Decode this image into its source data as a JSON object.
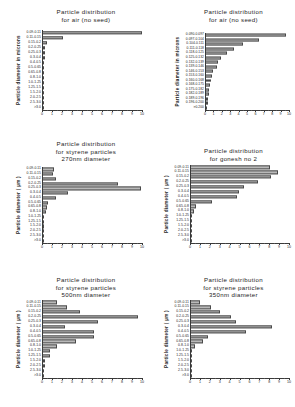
{
  "figure": {
    "panel_count": 6,
    "bar_color": "#b9b9b9",
    "bar_edge_color": "#4a4a4a",
    "axis_color": "#3a3a3a",
    "background": "#ffffff"
  },
  "chart_data": [
    {
      "type": "bar",
      "orientation": "horizontal",
      "title": "Particle distribution for air (no seed)",
      "title_lines": [
        "Particle distribution",
        "for air (no seed)"
      ],
      "xlabel": "",
      "ylabel": "Particle diameter in microns",
      "xlim": [
        0,
        10
      ],
      "ylim_categories": 16,
      "grid": false,
      "legend": "none",
      "xticks": [
        0,
        1,
        2,
        3,
        4,
        5,
        6,
        7,
        8,
        9,
        10
      ],
      "xticklabels": [
        "0",
        "1",
        "2",
        "3",
        "4",
        "5",
        "6",
        "7",
        "8",
        "9",
        "10"
      ],
      "categories": [
        "0.09-0.11",
        "0.11-0.15",
        "0.15-0.2",
        "0.2-0.25",
        "0.25-0.3",
        "0.3-0.4",
        "0.4-0.5",
        "0.5-0.65",
        "0.65-0.8",
        "0.8-1.0",
        "1.0-1.25",
        "1.25-1.5",
        "1.5-2.0",
        "2.0-2.5",
        "2.5-3.0",
        ">3.0"
      ],
      "values": [
        10.0,
        2.05,
        0.42,
        0.3,
        0.25,
        0.22,
        0.2,
        0.2,
        0.18,
        0.18,
        0.16,
        0.15,
        0.14,
        0.13,
        0.12,
        0.1
      ]
    },
    {
      "type": "bar",
      "orientation": "horizontal",
      "title": "Particle distribution for air (no seed)",
      "title_lines": [
        "Particle distribution",
        "for air (no seed)"
      ],
      "xlabel": "",
      "ylabel": "Particle diameter in microns",
      "xlim": [
        0,
        10
      ],
      "ylim_categories": 17,
      "grid": false,
      "legend": "none",
      "xticks": [
        0,
        1,
        2,
        3,
        4,
        5,
        6,
        7,
        8,
        9,
        10
      ],
      "xticklabels": [
        "0",
        "1",
        "2",
        "3",
        "4",
        "5",
        "6",
        "7",
        "8",
        "9",
        "10"
      ],
      "categories": [
        "0.090-0.097",
        "0.097-0.104",
        "0.104-0.111",
        "0.111-0.118",
        "0.118-0.125",
        "0.125-0.132",
        "0.132-0.139",
        "0.139-0.146",
        "0.146-0.153",
        "0.153-0.160",
        "0.160-0.168",
        "0.168-0.175",
        "0.175-0.182",
        "0.182-0.189",
        "0.189-0.196",
        "0.196-0.200",
        ">0.200"
      ],
      "values": [
        9.6,
        6.4,
        4.5,
        3.4,
        2.6,
        1.9,
        1.5,
        1.35,
        0.9,
        0.75,
        0.62,
        0.5,
        0.45,
        0.4,
        0.35,
        0.3,
        0.22
      ]
    },
    {
      "type": "bar",
      "orientation": "horizontal",
      "title": "Particle distribution for styrene particles 270nm diameter",
      "title_lines": [
        "Particle distribution",
        "for styrene particles",
        "270nm diameter"
      ],
      "xlabel": "",
      "ylabel": "Particle diameter  ( µm )",
      "xlim": [
        0,
        10
      ],
      "ylim_categories": 16,
      "grid": false,
      "legend": "none",
      "xticks": [
        0,
        1,
        2,
        3,
        4,
        5,
        6,
        7,
        8,
        9,
        10
      ],
      "xticklabels": [
        "0",
        "1",
        "2",
        "3",
        "4",
        "5",
        "6",
        "7",
        "8",
        "9",
        "10"
      ],
      "categories": [
        "0.09-0.11",
        "0.11-0.15",
        "0.15-0.2",
        "0.2-0.25",
        "0.25-0.3",
        "0.3-0.4",
        "0.4-0.5",
        "0.5-0.65",
        "0.65-0.8",
        "0.8-1.0",
        "1.0-1.25",
        "1.25-1.5",
        "1.5-2.0",
        "2.0-2.5",
        "2.5-3.0",
        ">3.0"
      ],
      "values": [
        1.15,
        1.1,
        1.35,
        7.6,
        9.9,
        2.6,
        1.35,
        0.55,
        0.45,
        0.4,
        0.2,
        0.15,
        0.12,
        0.1,
        0.1,
        0.08
      ]
    },
    {
      "type": "bar",
      "orientation": "horizontal",
      "title": "Particle distribution for gonesh no 2",
      "title_lines": [
        "Particle distribution",
        "for gonesh no 2"
      ],
      "xlabel": "",
      "ylabel": "Particle diameter  ( µm )",
      "xlim": [
        0,
        10
      ],
      "ylim_categories": 16,
      "grid": false,
      "legend": "none",
      "xticks": [
        0,
        1,
        2,
        3,
        4,
        5,
        6,
        7,
        8,
        9,
        10
      ],
      "xticklabels": [
        "0",
        "1",
        "2",
        "3",
        "4",
        "5",
        "6",
        "7",
        "8",
        "9",
        "10"
      ],
      "categories": [
        "0.09-0.11",
        "0.11-0.15",
        "0.15-0.2",
        "0.2-0.25",
        "0.25-0.3",
        "0.3-0.4",
        "0.4-0.5",
        "0.5-0.65",
        "0.65-0.8",
        "0.8-1.0",
        "1.0-1.25",
        "1.25-1.5",
        "1.5-2.0",
        "2.0-2.5",
        "2.5-3.0",
        ">3.0"
      ],
      "values": [
        8.0,
        8.8,
        8.1,
        6.8,
        5.4,
        4.9,
        4.7,
        2.2,
        0.55,
        0.35,
        0.1,
        0.1,
        0.08,
        0.08,
        0.07,
        0.06
      ]
    },
    {
      "type": "bar",
      "orientation": "horizontal",
      "title": "Particle distribution for styrene particles 500nm diameter",
      "title_lines": [
        "Particle distribution",
        "for styrene particles",
        "500nm diameter"
      ],
      "xlabel": "",
      "ylabel": "Particle diameter  ( µm )",
      "xlim": [
        0,
        10
      ],
      "ylim_categories": 16,
      "grid": false,
      "legend": "none",
      "xticks": [
        0,
        1,
        2,
        3,
        4,
        5,
        6,
        7,
        8,
        9,
        10
      ],
      "xticklabels": [
        "0",
        "1",
        "2",
        "3",
        "4",
        "5",
        "6",
        "7",
        "8",
        "9",
        "10"
      ],
      "categories": [
        "0.09-0.11",
        "0.11-0.15",
        "0.15-0.2",
        "0.2-0.25",
        "0.25-0.3",
        "0.3-0.4",
        "0.4-0.5",
        "0.5-0.65",
        "0.65-0.8",
        "0.8-1.0",
        "1.0-1.25",
        "1.25-1.5",
        "1.5-2.0",
        "2.0-2.5",
        "2.5-3.0",
        ">3.0"
      ],
      "values": [
        1.5,
        2.5,
        3.8,
        9.6,
        5.6,
        2.3,
        5.2,
        5.2,
        3.4,
        1.5,
        0.75,
        0.75,
        0.3,
        0.25,
        0.2,
        0.12
      ]
    },
    {
      "type": "bar",
      "orientation": "horizontal",
      "title": "Particle distribution for styrene particles 350nm diameter",
      "title_lines": [
        "Particle distribution",
        "for styrene particles",
        "350nm diameter"
      ],
      "xlabel": "",
      "ylabel": "Particle diameter  ( µm )",
      "xlim": [
        0,
        10
      ],
      "ylim_categories": 16,
      "grid": false,
      "legend": "none",
      "xticks": [
        0,
        1,
        2,
        3,
        4,
        5,
        6,
        7,
        8,
        9,
        10
      ],
      "xticklabels": [
        "0",
        "1",
        "2",
        "3",
        "4",
        "5",
        "6",
        "7",
        "8",
        "9",
        "10"
      ],
      "categories": [
        "0.09-0.11",
        "0.11-0.15",
        "0.15-0.2",
        "0.2-0.25",
        "0.25-0.3",
        "0.3-0.4",
        "0.4-0.5",
        "0.5-0.65",
        "0.65-0.8",
        "0.8-1.0",
        "1.0-1.25",
        "1.25-1.5",
        "1.5-2.0",
        "2.0-2.5",
        "2.5-3.0",
        ">3.0"
      ],
      "values": [
        1.0,
        2.1,
        3.0,
        4.1,
        4.6,
        8.2,
        5.6,
        1.8,
        1.3,
        0.5,
        0.15,
        0.12,
        0.1,
        0.1,
        0.08,
        0.07
      ]
    }
  ]
}
